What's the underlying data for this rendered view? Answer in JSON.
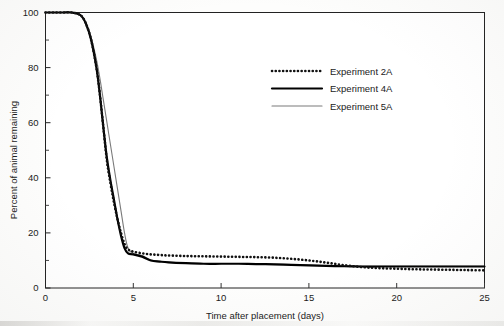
{
  "chart_data": {
    "type": "line",
    "title": "",
    "xlabel": "Time after placement (days)",
    "ylabel": "Percent of animal remaining",
    "xlim": [
      0,
      25
    ],
    "ylim": [
      0,
      100
    ],
    "xticks": [
      0,
      5,
      10,
      15,
      20,
      25
    ],
    "yticks": [
      0,
      20,
      40,
      60,
      80,
      100
    ],
    "y_minor_ticks": [
      10,
      30,
      50,
      70,
      90
    ],
    "grid": false,
    "legend_position": "upper-right-inside",
    "series": [
      {
        "name": "Experiment 2A",
        "style": "dotted",
        "color": "#111111",
        "width": 2.6,
        "x": [
          0,
          0.5,
          1,
          1.5,
          2,
          2.3,
          2.6,
          2.9,
          3.1,
          3.3,
          3.5,
          3.7,
          3.9,
          4.1,
          4.3,
          4.5,
          4.7,
          5,
          5.5,
          6,
          6.5,
          7,
          8,
          9,
          10,
          11,
          12,
          13,
          14,
          15,
          16,
          17,
          18,
          19,
          20,
          21,
          22,
          23,
          24,
          25
        ],
        "y": [
          100,
          100,
          100,
          100,
          99,
          96,
          90,
          80,
          70,
          58,
          46,
          38,
          31,
          25,
          20,
          16,
          14,
          13.2,
          12.6,
          12.2,
          12.0,
          11.8,
          11.6,
          11.5,
          11.4,
          11.3,
          11.2,
          11.0,
          10.6,
          10.0,
          9.2,
          8.3,
          7.6,
          7.2,
          7.0,
          6.8,
          6.7,
          6.6,
          6.5,
          6.4
        ]
      },
      {
        "name": "Experiment 4A",
        "style": "solid",
        "color": "#000000",
        "width": 2.2,
        "x": [
          0,
          0.5,
          1,
          1.5,
          2,
          2.3,
          2.6,
          2.9,
          3.1,
          3.3,
          3.5,
          3.7,
          3.9,
          4.1,
          4.3,
          4.5,
          4.7,
          5,
          5.5,
          6,
          6.5,
          7,
          8,
          9,
          10,
          11,
          12,
          13,
          14,
          15,
          16,
          17,
          18,
          19,
          20,
          21,
          22,
          23,
          24,
          25
        ],
        "y": [
          100,
          100,
          100,
          100,
          99,
          96,
          90,
          80,
          70,
          58,
          47,
          39,
          32,
          25,
          19,
          14.5,
          12.6,
          12.2,
          11.4,
          10.0,
          9.6,
          9.3,
          9.0,
          8.8,
          8.8,
          8.8,
          8.7,
          8.6,
          8.4,
          8.2,
          8.0,
          7.9,
          7.8,
          7.8,
          7.8,
          7.8,
          7.8,
          7.8,
          7.8,
          7.8
        ]
      },
      {
        "name": "Experiment 5A",
        "style": "solid",
        "color": "#7a7a7a",
        "width": 1.1,
        "x": [
          0,
          0.5,
          1,
          1.5,
          2,
          2.3,
          2.6,
          2.9,
          3.1,
          3.3,
          3.5,
          3.7,
          3.9,
          4.1,
          4.3,
          4.5,
          4.7,
          5,
          5.5,
          6,
          6.5,
          7,
          8,
          9,
          10,
          11,
          12,
          13,
          14,
          15,
          16,
          17,
          18,
          19,
          20,
          21,
          22,
          23,
          24,
          25
        ],
        "y": [
          100,
          100,
          100,
          100,
          99,
          96,
          91,
          83,
          76,
          68,
          60,
          52,
          44,
          36,
          28,
          20,
          14.5,
          12.5,
          11.8,
          10.2,
          9.7,
          9.4,
          9.1,
          8.9,
          8.9,
          8.9,
          8.8,
          8.7,
          8.5,
          8.3,
          8.1,
          8.0,
          7.9,
          7.9,
          7.9,
          7.9,
          7.9,
          7.9,
          7.9,
          7.9
        ]
      }
    ]
  },
  "legend": {
    "items": [
      {
        "label": "Experiment 2A"
      },
      {
        "label": "Experiment 4A"
      },
      {
        "label": "Experiment 5A"
      }
    ]
  },
  "axes": {
    "x_tick_labels": [
      "0",
      "5",
      "10",
      "15",
      "20",
      "25"
    ],
    "y_tick_labels": [
      "0",
      "20",
      "40",
      "60",
      "80",
      "100"
    ],
    "x_title": "Time after placement (days)",
    "y_title": "Percent of animal remaining"
  }
}
